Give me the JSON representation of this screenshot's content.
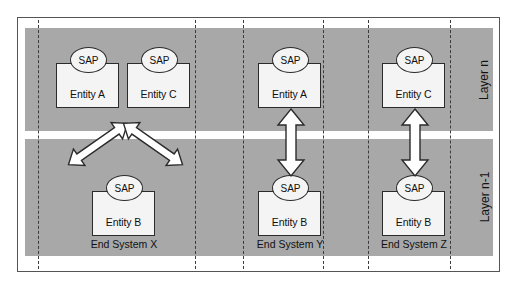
{
  "figure": {
    "colors": {
      "band_gray": "#a8a8a8",
      "frame_border": "#555555",
      "stroke": "#2b2b2b",
      "box_fill": "#f4f4f4",
      "page_background": "#ffffff"
    }
  },
  "layers": [
    {
      "id": "layer-n",
      "caption": "Layer n"
    },
    {
      "id": "layer-n-1",
      "caption": "Layer n-1"
    }
  ],
  "systems": [
    {
      "id": "x",
      "caption": "End System X"
    },
    {
      "id": "y",
      "caption": "End System Y"
    },
    {
      "id": "z",
      "caption": "End System Z"
    }
  ],
  "sap_label": "SAP",
  "entities": [
    {
      "id": "x-top-a",
      "label": "Entity A",
      "sap": "SAP",
      "layer": "Layer n",
      "system": "End System X"
    },
    {
      "id": "x-top-c",
      "label": "Entity C",
      "sap": "SAP",
      "layer": "Layer n",
      "system": "End System X"
    },
    {
      "id": "x-bottom-b",
      "label": "Entity B",
      "sap": "SAP",
      "layer": "Layer n-1",
      "system": "End System X"
    },
    {
      "id": "y-top-a",
      "label": "Entity A",
      "sap": "SAP",
      "layer": "Layer n",
      "system": "End System Y"
    },
    {
      "id": "y-bottom-b",
      "label": "Entity B",
      "sap": "SAP",
      "layer": "Layer n-1",
      "system": "End System Y"
    },
    {
      "id": "z-top-c",
      "label": "Entity C",
      "sap": "SAP",
      "layer": "Layer n",
      "system": "End System Z"
    },
    {
      "id": "z-bottom-b",
      "label": "Entity B",
      "sap": "SAP",
      "layer": "Layer n-1",
      "system": "End System Z"
    }
  ],
  "connections": [
    {
      "id": "x-a-to-b",
      "from": "Entity A",
      "to": "Entity B",
      "system": "End System X",
      "style": "double-headed-diagonal"
    },
    {
      "id": "x-c-to-b",
      "from": "Entity C",
      "to": "Entity B",
      "system": "End System X",
      "style": "double-headed-diagonal"
    },
    {
      "id": "y-a-to-b",
      "from": "Entity A",
      "to": "Entity B",
      "system": "End System Y",
      "style": "double-headed-vertical"
    },
    {
      "id": "z-c-to-b",
      "from": "Entity C",
      "to": "Entity B",
      "system": "End System Z",
      "style": "double-headed-vertical"
    }
  ]
}
